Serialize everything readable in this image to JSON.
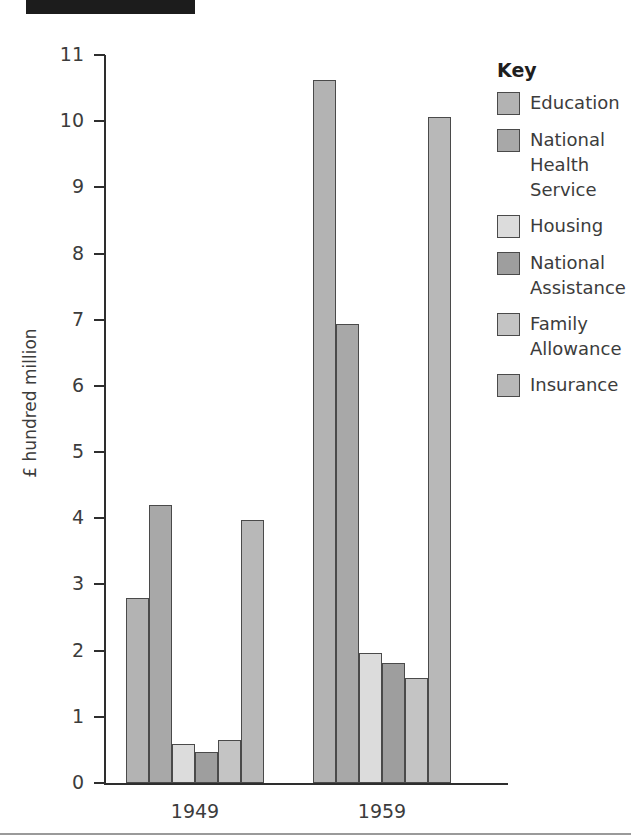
{
  "header": {
    "redaction_bar": ""
  },
  "chart_data": {
    "type": "bar",
    "title": "",
    "xlabel": "",
    "ylabel": "£ hundred million",
    "ylim": [
      0,
      11
    ],
    "yticks": [
      0,
      1,
      2,
      3,
      4,
      5,
      6,
      7,
      8,
      9,
      10,
      11
    ],
    "ytick_labels": [
      "0",
      "1",
      "2",
      "3",
      "4",
      "5",
      "6",
      "7",
      "8",
      "9",
      "10",
      "11"
    ],
    "grid": false,
    "legend_position": "right",
    "legend_title": "Key",
    "categories": [
      "1949",
      "1959"
    ],
    "series": [
      {
        "name": "Education",
        "values": [
          2.8,
          10.62
        ],
        "color": "#b3b3b3"
      },
      {
        "name": "National Health Service",
        "values": [
          4.2,
          6.93
        ],
        "color": "#a8a8a8"
      },
      {
        "name": "Housing",
        "values": [
          0.59,
          1.97
        ],
        "color": "#dcdcdc"
      },
      {
        "name": "National Assistance",
        "values": [
          0.47,
          1.81
        ],
        "color": "#9e9e9e"
      },
      {
        "name": "Family Allowance",
        "values": [
          0.65,
          1.58
        ],
        "color": "#c4c4c4"
      },
      {
        "name": "Insurance",
        "values": [
          3.97,
          10.07
        ],
        "color": "#b8b8b8"
      }
    ]
  },
  "colors": {
    "axis": "#2e2e2e",
    "text": "#3c3c3c",
    "bar_border": "#4a4a4a",
    "header_bar": "#1c1c1c",
    "footer_rule": "#9a9a9a"
  }
}
